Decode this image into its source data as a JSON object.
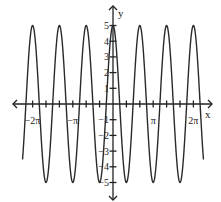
{
  "chart_data": {
    "type": "line",
    "title": "",
    "function": "y = 5cos(3x)",
    "xlabel": "x",
    "ylabel": "y",
    "xlim": [
      -2.25,
      2.25
    ],
    "xlim_units": "pi",
    "ylim": [
      -5,
      5
    ],
    "x_tick_step_pi": 0.3333,
    "x_tick_labels": [
      {
        "value_pi": -2,
        "label": "−2π"
      },
      {
        "value_pi": -1,
        "label": "−π"
      },
      {
        "value_pi": 1,
        "label": "π"
      },
      {
        "value_pi": 2,
        "label": "2π"
      }
    ],
    "y_tick_labels": [
      "5",
      "4",
      "3",
      "2",
      "1",
      "−1",
      "−2",
      "−3",
      "−4",
      "−5"
    ],
    "y_ticks": [
      5,
      4,
      3,
      2,
      1,
      -1,
      -2,
      -3,
      -4,
      -5
    ],
    "series": [
      {
        "name": "5cos(3x)",
        "amplitude": 5,
        "frequency": 3,
        "period_pi": 0.6667,
        "peaks_pi": [
          -2,
          -1.3333,
          -0.6667,
          0,
          0.6667,
          1.3333,
          2
        ],
        "troughs_pi": [
          -1.6667,
          -1,
          -0.3333,
          0.3333,
          1,
          1.6667
        ]
      }
    ],
    "grid": false,
    "legend": null
  },
  "colors": {
    "curve": "#2a2a2a",
    "axis": "#222222"
  }
}
